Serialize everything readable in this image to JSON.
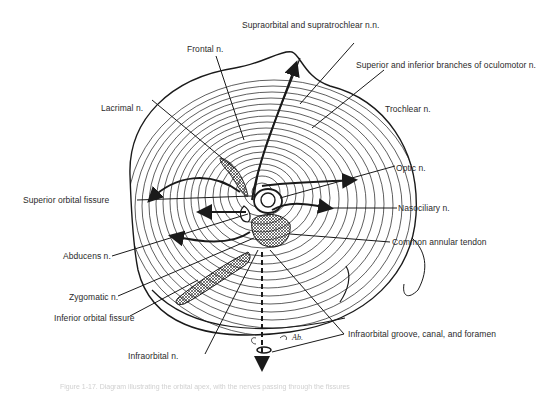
{
  "figure": {
    "signature": "Ab.",
    "caption": "Figure 1-17. Diagram illustrating the orbital apex, with the nerves passing through the fissures"
  },
  "labels": {
    "supraorbital": "Supraorbital and supratrochlear n.n.",
    "frontal": "Frontal n.",
    "oculomotor": "Superior and inferior branches of oculomotor n.",
    "trochlear": "Trochlear n.",
    "lacrimal": "Lacrimal n.",
    "optic": "Optic n.",
    "superior_orbital_fissure": "Superior orbital fissure",
    "nasociliary": "Nasociliary n.",
    "abducens": "Abducens n.",
    "common_annular_tendon": "Common annular tendon",
    "zygomatic": "Zygomatic n.",
    "inferior_orbital_fissure": "Inferior orbital fissure",
    "infraorbital_groove": "Infraorbital groove, canal, and foramen",
    "infraorbital": "Infraorbital n."
  },
  "colors": {
    "ink": "#1a1a1a",
    "label_text": "#2a2a2a",
    "caption_text": "#d0d0d0",
    "background": "#ffffff"
  }
}
